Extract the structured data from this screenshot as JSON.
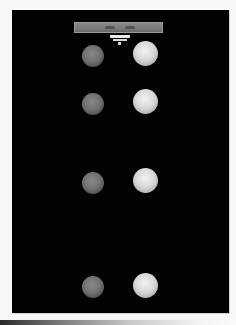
{
  "image": {
    "description": "Photograph of eight spheres arranged in two columns on a black background, with a gray label strip at the top",
    "background_color": "#020202",
    "page_color": "#f8f8f8"
  },
  "label_strip": {
    "text": ""
  },
  "spheres": {
    "rows": [
      {
        "left": {
          "shade": "dim",
          "cx": 93,
          "cy": 56
        },
        "right": {
          "shade": "bright",
          "cx": 145,
          "cy": 53
        }
      },
      {
        "left": {
          "shade": "dim",
          "cx": 93,
          "cy": 104
        },
        "right": {
          "shade": "bright",
          "cx": 145,
          "cy": 101
        }
      },
      {
        "left": {
          "shade": "dim",
          "cx": 93,
          "cy": 183
        },
        "right": {
          "shade": "bright",
          "cx": 145,
          "cy": 180
        }
      },
      {
        "left": {
          "shade": "dim",
          "cx": 93,
          "cy": 287
        },
        "right": {
          "shade": "bright",
          "cx": 145,
          "cy": 285
        }
      }
    ]
  }
}
